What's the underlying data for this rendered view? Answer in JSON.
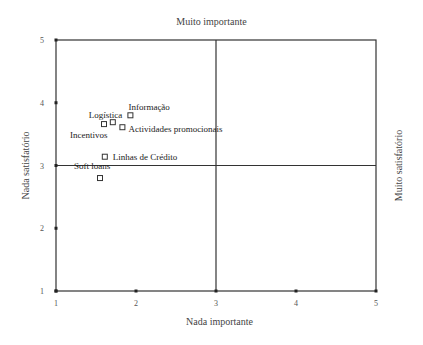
{
  "chart_data": {
    "type": "scatter",
    "title": "Muito importante",
    "xlabel": "Nada importante",
    "ylabel": "Nada satisfatório",
    "y2label": "Muito satisfatório",
    "xlim": [
      1,
      5
    ],
    "ylim": [
      1,
      5
    ],
    "xticks": [
      "1",
      "2",
      "3",
      "4",
      "5"
    ],
    "yticks": [
      "1",
      "2",
      "3",
      "4",
      "5"
    ],
    "grid": false,
    "reference_lines": {
      "x": 3,
      "y": 3
    },
    "marker": "square-open",
    "points": [
      {
        "label": "Incentivos",
        "x": 1.6,
        "y": 3.66
      },
      {
        "label": "Logística",
        "x": 1.71,
        "y": 3.69
      },
      {
        "label": "Informação",
        "x": 1.93,
        "y": 3.8
      },
      {
        "label": "Actividades promocionais",
        "x": 1.83,
        "y": 3.61
      },
      {
        "label": "Linhas de Crédito",
        "x": 1.61,
        "y": 3.14
      },
      {
        "label": "Soft loans",
        "x": 1.55,
        "y": 2.8
      }
    ]
  },
  "labels": {
    "top": "Muito importante",
    "bottom": "Nada importante",
    "left": "Nada satisfatório",
    "right": "Muito satisfatório"
  }
}
